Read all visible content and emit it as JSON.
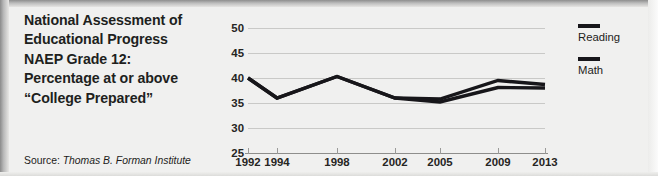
{
  "title": {
    "lines": [
      "National Assessment of",
      "Educational Progress",
      "NAEP Grade 12:",
      "Percentage at or above",
      "“College Prepared”"
    ]
  },
  "source": {
    "label": "Source:",
    "name": "Thomas B. Forman Institute"
  },
  "legend": {
    "entries": [
      {
        "label": "Reading",
        "color": "#17161a"
      },
      {
        "label": "Math",
        "color": "#17161a"
      }
    ]
  },
  "chart_data": {
    "type": "line",
    "title": "National Assessment of Educational Progress NAEP Grade 12: Percentage at or above “College Prepared”",
    "xlabel": "",
    "ylabel": "",
    "x": [
      1992,
      1994,
      1998,
      2002,
      2005,
      2009,
      2013
    ],
    "xticklabels": [
      "1992",
      "1994",
      "1998",
      "2002",
      "2005",
      "2009",
      "2013"
    ],
    "yticks": [
      25,
      30,
      35,
      40,
      45,
      50
    ],
    "yticklabels": [
      "25",
      "30",
      "35",
      "40",
      "45",
      "50"
    ],
    "ylim": [
      25,
      50
    ],
    "xlim": [
      1992,
      2013
    ],
    "grid": true,
    "legend_position": "right",
    "series": [
      {
        "name": "Reading",
        "color": "#17161a",
        "x": [
          1992,
          1994,
          1998,
          2002,
          2005,
          2009,
          2013
        ],
        "values": [
          40.0,
          36.0,
          40.3,
          36.0,
          35.8,
          39.5,
          38.7
        ]
      },
      {
        "name": "Math",
        "color": "#17161a",
        "x": [
          1992,
          1994,
          1998,
          2002,
          2005,
          2009,
          2013
        ],
        "values": [
          40.0,
          36.0,
          40.3,
          36.0,
          35.2,
          38.1,
          38.0
        ]
      }
    ]
  }
}
